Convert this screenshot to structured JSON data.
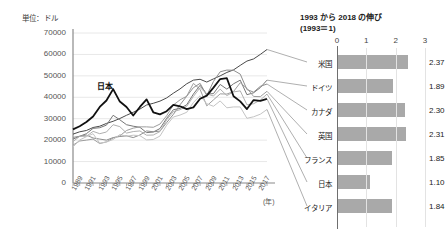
{
  "unit_label": "単位：ドル",
  "line_chart": {
    "series_annotation": "日本",
    "year_axis_unit": "(年)",
    "y_ticks": [
      "70000",
      "60000",
      "50000",
      "40000",
      "30000",
      "20000",
      "10000",
      "0"
    ],
    "x_ticks": [
      "1989",
      "1991",
      "1993",
      "1995",
      "1997",
      "1999",
      "2001",
      "2003",
      "2005",
      "2007",
      "2009",
      "2011",
      "2013",
      "2015",
      "2017"
    ]
  },
  "bar_chart": {
    "title_line1": "1993 から 2018 の伸び",
    "title_line2": "(1993＝1)",
    "axis_ticks": [
      "0",
      "1",
      "2",
      "3"
    ],
    "rows": [
      {
        "label": "米国",
        "value": "2.37"
      },
      {
        "label": "ドイツ",
        "value": "1.89"
      },
      {
        "label": "カナダ",
        "value": "2.30"
      },
      {
        "label": "英国",
        "value": "2.31"
      },
      {
        "label": "フランス",
        "value": "1.85"
      },
      {
        "label": "日本",
        "value": "1.10"
      },
      {
        "label": "イタリア",
        "value": "1.84"
      }
    ]
  },
  "chart_data": [
    {
      "type": "line",
      "title": "",
      "xlabel": "(年)",
      "ylabel": "単位：ドル",
      "ylim": [
        0,
        70000
      ],
      "xlim": [
        1989,
        2018
      ],
      "grid": true,
      "legend": "inline-annotation",
      "x": [
        1989,
        1990,
        1991,
        1992,
        1993,
        1994,
        1995,
        1996,
        1997,
        1998,
        1999,
        2000,
        2001,
        2002,
        2003,
        2004,
        2005,
        2006,
        2007,
        2008,
        2009,
        2010,
        2011,
        2012,
        2013,
        2014,
        2015,
        2016,
        2017,
        2018
      ],
      "series": [
        {
          "name": "日本",
          "color": "#111111",
          "emphasis": true,
          "values": [
            25000,
            26500,
            28500,
            31000,
            35500,
            38500,
            43800,
            38000,
            35500,
            31500,
            35500,
            39000,
            33000,
            32000,
            33500,
            36500,
            35800,
            34500,
            35300,
            39300,
            40800,
            44500,
            48500,
            48900,
            40500,
            38100,
            34500,
            38700,
            38300,
            39300
          ]
        },
        {
          "name": "米国",
          "color": "#4a4a4a",
          "emphasis": false,
          "values": [
            22800,
            23900,
            24500,
            25900,
            26500,
            27800,
            28800,
            30100,
            31600,
            33000,
            34500,
            36400,
            37200,
            38200,
            39700,
            41900,
            43900,
            46300,
            48000,
            48400,
            47100,
            48600,
            50000,
            51600,
            52800,
            54900,
            56900,
            57900,
            60000,
            62300
          ]
        },
        {
          "name": "ドイツ",
          "color": "#777777",
          "emphasis": false,
          "values": [
            20500,
            21800,
            23000,
            25500,
            25800,
            27000,
            31600,
            29500,
            27200,
            26500,
            26000,
            23500,
            23800,
            25400,
            30200,
            34200,
            34800,
            36500,
            41500,
            45600,
            41500,
            41700,
            46000,
            43800,
            46300,
            48000,
            41200,
            42100,
            44500,
            48000
          ]
        },
        {
          "name": "カナダ",
          "color": "#8e8e8e",
          "emphasis": false,
          "values": [
            21300,
            21800,
            22400,
            21000,
            20500,
            20000,
            21200,
            21700,
            22000,
            21200,
            22400,
            24300,
            23900,
            24200,
            28200,
            32000,
            36500,
            40500,
            44500,
            46500,
            40800,
            47400,
            51900,
            52700,
            52600,
            50800,
            43600,
            42400,
            45100,
            46200
          ]
        },
        {
          "name": "英国",
          "color": "#9d9d9d",
          "emphasis": false,
          "values": [
            17700,
            19600,
            20000,
            20500,
            18400,
            19200,
            21000,
            22000,
            24500,
            25600,
            26200,
            26200,
            26000,
            27500,
            31400,
            36400,
            38800,
            40500,
            46500,
            43700,
            36000,
            38800,
            41600,
            41500,
            42700,
            46800,
            44200,
            40400,
            40300,
            42800
          ]
        },
        {
          "name": "フランス",
          "color": "#b0b0b0",
          "emphasis": false,
          "values": [
            19300,
            21800,
            21800,
            24100,
            23000,
            23800,
            27200,
            26300,
            23300,
            24000,
            24300,
            22300,
            22400,
            24000,
            29500,
            33300,
            34200,
            35800,
            40400,
            44500,
            41600,
            40600,
            43800,
            40800,
            42500,
            43000,
            36500,
            37000,
            38700,
            41500
          ]
        },
        {
          "name": "イタリア",
          "color": "#c4c4c4",
          "emphasis": false,
          "values": [
            16800,
            20100,
            21600,
            23000,
            18600,
            19100,
            20300,
            22600,
            21800,
            22300,
            22100,
            20100,
            20300,
            21900,
            27000,
            30800,
            31700,
            33000,
            37600,
            40700,
            37000,
            35800,
            38300,
            35100,
            35500,
            35500,
            30200,
            30900,
            32100,
            34300
          ]
        }
      ]
    },
    {
      "type": "bar",
      "orientation": "horizontal",
      "title": "1993 から 2018 の伸び (1993＝1)",
      "xlabel": "",
      "ylabel": "",
      "xlim": [
        0,
        3
      ],
      "grid": true,
      "categories": [
        "米国",
        "ドイツ",
        "カナダ",
        "英国",
        "フランス",
        "日本",
        "イタリア"
      ],
      "values": [
        2.37,
        1.89,
        2.3,
        2.31,
        1.85,
        1.1,
        1.84
      ],
      "bar_color": "#a9a9a9"
    }
  ]
}
